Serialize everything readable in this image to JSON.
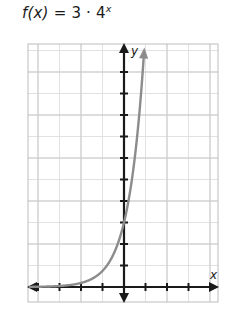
{
  "figure": {
    "equation_text": "f(x) = 3 · 4",
    "equation_prefix": "f",
    "equation_arg": "(x)",
    "equation_middle": " = 3 · 4",
    "equation_exponent": "x",
    "x_axis_label": "x",
    "y_axis_label": "y"
  },
  "colors": {
    "background": "#ffffff",
    "grid_major": "#c9c9c9",
    "grid_minor": "#e2e2e2",
    "grid_border": "#bdbdbd",
    "axis": "#1a1a1a",
    "curve": "#8c8c8c",
    "text": "#1a1a1a"
  },
  "chart_data": {
    "type": "line",
    "function": "f(x) = 3 * 4^x",
    "xlabel": "x",
    "ylabel": "y",
    "grid": true,
    "legend": null,
    "xlim": [
      -4.5,
      4.3
    ],
    "ylim": [
      -1.0,
      10.6
    ],
    "x_tick_step": 1,
    "y_tick_step": 1,
    "x_ticks": [
      -4,
      -3,
      -2,
      -1,
      0,
      1,
      2,
      3,
      4
    ],
    "y_ticks": [
      1,
      2,
      3,
      4,
      5,
      6,
      7,
      8,
      9,
      10
    ],
    "tick_labels_shown": false,
    "series": [
      {
        "name": "f(x) = 3 · 4^x",
        "color": "#8c8c8c",
        "arrow_end": true,
        "x": [
          -4.5,
          -4.0,
          -3.5,
          -3.0,
          -2.5,
          -2.0,
          -1.5,
          -1.0,
          -0.5,
          0.0,
          0.25,
          0.5,
          0.75,
          0.9
        ],
        "y": [
          0.012,
          0.012,
          0.023,
          0.047,
          0.094,
          0.188,
          0.375,
          0.75,
          1.5,
          3.0,
          4.24,
          6.0,
          8.49,
          10.3
        ]
      }
    ]
  },
  "geometry": {
    "grid_left": 28,
    "grid_top": 44,
    "grid_right": 218,
    "grid_bottom": 302,
    "cell": 21.5,
    "origin_x": 124,
    "origin_y": 287
  }
}
